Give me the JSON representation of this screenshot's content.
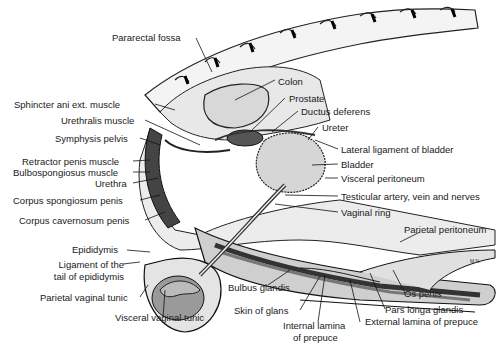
{
  "diagram": {
    "labels": {
      "pararectal_fossa": "Pararectal fossa",
      "colon": "Colon",
      "prostate": "Prostate",
      "ductus_deferens": "Ductus deferens",
      "ureter": "Ureter",
      "lateral_ligament": "Lateral ligament of bladder",
      "bladder": "Bladder",
      "visceral_peritoneum": "Visceral peritoneum",
      "testicular_artery": "Testicular artery, vein and nerves",
      "vaginal_ring": "Vaginal ring",
      "parietal_peritoneum": "Parietal peritoneum",
      "sphincter_ani": "Sphincter ani ext. muscle",
      "urethralis": "Urethralis muscle",
      "symphysis": "Symphysis pelvis",
      "retractor_penis": "Retractor penis muscle",
      "bulbospongiosus": "Bulbospongiosus muscle",
      "urethra": "Urethra",
      "corpus_spongiosum": "Corpus spongiosum penis",
      "corpus_cavernosum": "Corpus cavernosum penis",
      "epididymis": "Epididymis",
      "ligament_tail_1": "Ligament of the",
      "ligament_tail_2": "tail of epididymis",
      "parietal_vaginal_tunic": "Parietal vaginal tunic",
      "visceral_vaginal_tunic": "Visceral vaginal tunic",
      "bulbus_glandis": "Bulbus glandis",
      "skin_of_glans": "Skin of glans",
      "internal_lamina_1": "Internal lamina",
      "internal_lamina_2": "of prepuce",
      "external_lamina": "External lamina of prepuce",
      "pars_longa": "Pars longa glandis",
      "os_penis": "Os penis"
    },
    "signature": "M.N."
  }
}
